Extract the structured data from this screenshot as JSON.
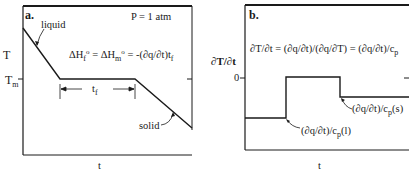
{
  "panel_a": {
    "letter": "a.",
    "pressure": "P = 1 atm",
    "y_axis_label": "T",
    "y_tick_main": "T",
    "y_tick_sub": "m",
    "x_axis_label": "t",
    "equation_delta": "ΔH",
    "equation_f": "f",
    "equation_o1": "o",
    "equation_mid": " = ΔH",
    "equation_m": "m",
    "equation_o2": "o",
    "equation_rhs": " = -(∂q/∂t)t",
    "equation_tf": "f",
    "span_label": "t",
    "span_sub": "f",
    "liquid_label": "liquid",
    "solid_label": "solid"
  },
  "panel_b": {
    "letter": "b.",
    "y_axis_label": "∂T/∂t",
    "y_tick_zero": "0",
    "x_axis_label": "t",
    "equation": "∂T/∂t = (∂q/∂t)/(∂q/∂T) = (∂q/∂t)/c",
    "equation_sub": "p",
    "liquid_annot": "(∂q/∂t)/c",
    "liquid_annot_sub": "p",
    "liquid_annot_tail": "(l)",
    "solid_annot": "(∂q/∂t)/c",
    "solid_annot_sub": "p",
    "solid_annot_tail": "(s)"
  },
  "colors": {
    "line": "#1a1a1a",
    "background": "#ffffff"
  }
}
